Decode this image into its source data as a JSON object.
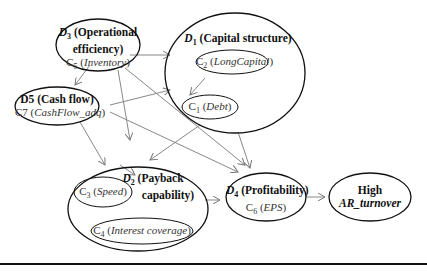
{
  "nodes": {
    "d3": {
      "id": "D",
      "sub": "3",
      "title": "(Operational",
      "title2": "efficiency)",
      "c_id": "C",
      "c_sub": "5",
      "c_name": "Inventory"
    },
    "d1": {
      "id": "D",
      "sub": "1",
      "title": "(Capital structure)"
    },
    "c2": {
      "id": "C",
      "sub": "2",
      "name": "LongCapital"
    },
    "c1": {
      "id": "C",
      "sub": "1",
      "name": "Debt"
    },
    "d5": {
      "title": "D5 (Cash flow)",
      "c_label": "C7",
      "c_name": "CashFlow_adq"
    },
    "d2": {
      "id": "D",
      "sub": "2",
      "title": "(Payback",
      "title2": "capability)"
    },
    "c3": {
      "id": "C",
      "sub": "3",
      "name": "Speed"
    },
    "c4": {
      "id": "C",
      "sub": "4",
      "name": "Interest coverage"
    },
    "d4": {
      "id": "D",
      "sub": "4",
      "title": "(Profitability)",
      "c_id": "C",
      "c_sub": "6",
      "c_name": "EPS"
    },
    "out": {
      "line1": "High",
      "line2": "AR_turnover"
    }
  },
  "colors": {
    "edge": "#777777",
    "stroke": "#111111"
  }
}
